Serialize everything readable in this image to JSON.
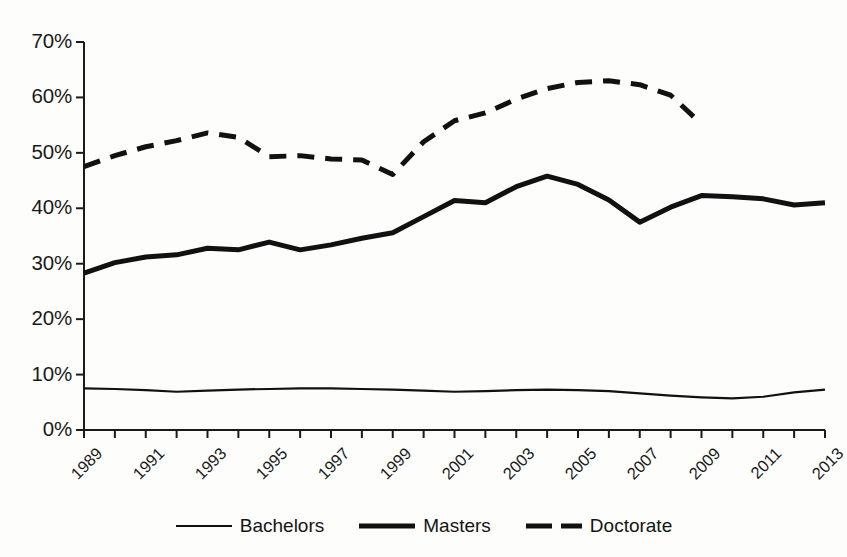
{
  "chart_data": {
    "type": "line",
    "title": "",
    "subtitle": "",
    "xlabel": "",
    "ylabel": "",
    "xlim": [
      1989,
      2013
    ],
    "ylim": [
      0,
      70
    ],
    "ytick_values": [
      0,
      10,
      20,
      30,
      40,
      50,
      60,
      70
    ],
    "ytick_labels": [
      "0%",
      "10%",
      "20%",
      "30%",
      "40%",
      "50%",
      "60%",
      "70%"
    ],
    "x": [
      1989,
      1990,
      1991,
      1992,
      1993,
      1994,
      1995,
      1996,
      1997,
      1998,
      1999,
      2000,
      2001,
      2002,
      2003,
      2004,
      2005,
      2006,
      2007,
      2008,
      2009,
      2010,
      2011,
      2012,
      2013
    ],
    "xtick_labels": [
      "1989",
      "1991",
      "1993",
      "1995",
      "1997",
      "1999",
      "2001",
      "2003",
      "2005",
      "2007",
      "2009",
      "2011",
      "2013"
    ],
    "xtick_label_years": [
      1989,
      1991,
      1993,
      1995,
      1997,
      1999,
      2001,
      2003,
      2005,
      2007,
      2009,
      2011,
      2013
    ],
    "xtick_every": 1,
    "xlabel_every": 2,
    "grid": false,
    "legend_position": "bottom",
    "series": [
      {
        "name": "Bachelors",
        "style": "solid-thin",
        "color": "#111111",
        "values": [
          7.5,
          7.4,
          7.2,
          6.9,
          7.1,
          7.3,
          7.4,
          7.5,
          7.5,
          7.4,
          7.3,
          7.1,
          6.9,
          7.0,
          7.2,
          7.3,
          7.2,
          7.0,
          6.6,
          6.2,
          5.9,
          5.7,
          6.0,
          6.8,
          7.3
        ]
      },
      {
        "name": "Masters",
        "style": "solid-thick",
        "color": "#111111",
        "values": [
          28.3,
          30.2,
          31.2,
          31.6,
          32.8,
          32.5,
          33.9,
          32.5,
          33.4,
          34.6,
          35.6,
          38.5,
          41.4,
          41.0,
          43.9,
          45.8,
          44.3,
          41.5,
          37.5,
          40.2,
          42.3,
          42.1,
          41.7,
          40.6,
          41.0
        ]
      },
      {
        "name": "Doctorate",
        "style": "dashed-thick",
        "color": "#111111",
        "values": [
          47.5,
          49.5,
          51.1,
          52.2,
          53.6,
          52.8,
          49.3,
          49.5,
          48.9,
          48.7,
          46.1,
          52.0,
          55.8,
          57.2,
          59.7,
          61.6,
          62.7,
          63.0,
          62.3,
          60.4,
          55.2,
          null,
          null,
          null,
          null
        ]
      }
    ]
  },
  "legend": {
    "entries": [
      {
        "label": "Bachelors",
        "style": "solid-thin"
      },
      {
        "label": "Masters",
        "style": "solid-thick"
      },
      {
        "label": "Doctorate",
        "style": "dashed-thick"
      }
    ]
  }
}
